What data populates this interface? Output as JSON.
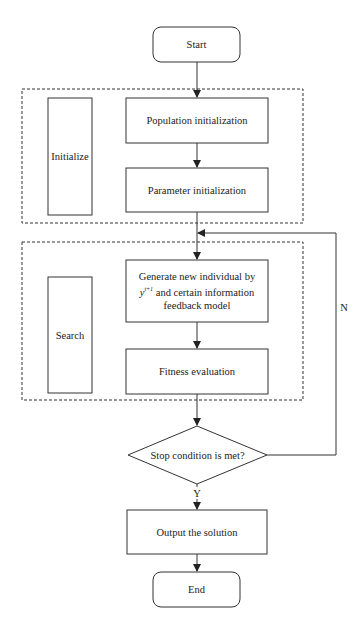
{
  "flowchart": {
    "start": {
      "label": "Start"
    },
    "groups": {
      "initialize": {
        "label": "Initialize"
      },
      "search": {
        "label": "Search"
      }
    },
    "steps": {
      "population_init": {
        "label": "Population initialization"
      },
      "parameter_init": {
        "label": "Parameter initialization"
      },
      "generate": {
        "line1": "Generate new individual by",
        "line2_var": "y",
        "line2_sup": "t+1",
        "line2_rest": " and certain information",
        "line3": "feedback model"
      },
      "fitness": {
        "label": "Fitness evaluation"
      },
      "output": {
        "label": "Output the solution"
      }
    },
    "decision": {
      "label": "Stop condition is met?",
      "yes_label": "Y",
      "no_label": "N"
    },
    "end": {
      "label": "End"
    }
  },
  "colors": {
    "stroke": "#333333",
    "background": "#ffffff",
    "text": "#222222"
  }
}
